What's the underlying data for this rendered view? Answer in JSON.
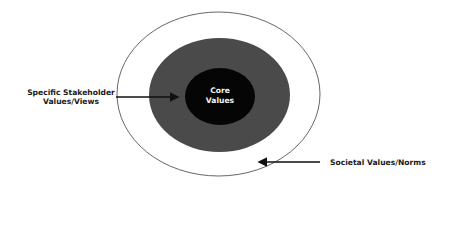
{
  "diagram": {
    "type": "concentric-ellipses",
    "colors": {
      "background": "#ffffff",
      "outer_fill": "#ffffff",
      "outer_stroke": "#555555",
      "middle_fill": "#4a4a4a",
      "inner_fill": "#050505",
      "arrow": "#111111",
      "label_text": "#1a1a1a",
      "core_text": "#f2f2f2"
    },
    "layers": [
      {
        "name": "Societal Values/Norms",
        "level": "outer"
      },
      {
        "name": "Specific Stakeholder Values/Views",
        "level": "middle"
      },
      {
        "name": "Core Values",
        "level": "inner"
      }
    ],
    "core": {
      "line1": "Core",
      "line2": "Values"
    },
    "left_label": {
      "line1": "Specific Stakeholder",
      "line2": "Values/Views"
    },
    "right_label": {
      "text": "Societal Values/Norms"
    }
  }
}
